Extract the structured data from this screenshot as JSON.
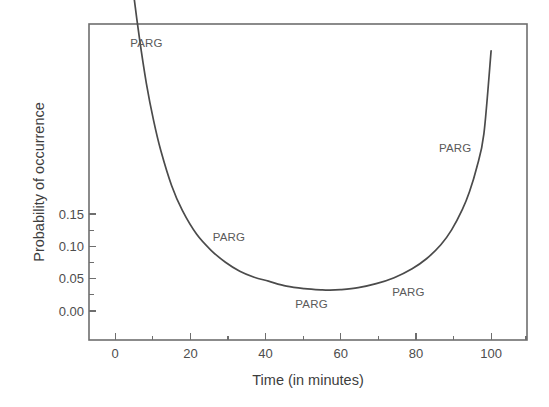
{
  "chart_data": {
    "type": "line",
    "title": "",
    "subtitle": "",
    "xlabel": "Time (in minutes)",
    "ylabel": "Probability of occurrence",
    "xlim": [
      -10,
      112
    ],
    "ylim": [
      -0.022,
      0.295
    ],
    "grid": false,
    "legend_position": "none",
    "x_ticks_major": [
      0,
      20,
      40,
      60,
      80,
      100
    ],
    "x_tick_labels": [
      "0",
      "20",
      "40",
      "60",
      "80",
      "100"
    ],
    "x_ticks_minor": [
      -10,
      10,
      30,
      50,
      70,
      90,
      110
    ],
    "y_ticks_major": [
      0.0,
      0.05,
      0.1,
      0.15
    ],
    "y_tick_labels": [
      "0.00",
      "0.05",
      "0.10",
      "0.15"
    ],
    "y_ticks_minor": [
      0.025,
      0.075,
      0.125
    ],
    "series": [
      {
        "name": "PARG",
        "x": [
          0,
          2,
          4,
          6,
          8,
          10,
          13,
          16,
          20,
          24,
          28,
          32,
          36,
          40,
          45,
          50,
          55,
          57,
          60,
          65,
          70,
          75,
          80,
          84,
          88,
          91,
          94,
          96,
          98,
          100,
          102
        ],
        "y": [
          0.405,
          0.338,
          0.282,
          0.235,
          0.198,
          0.168,
          0.133,
          0.108,
          0.084,
          0.068,
          0.056,
          0.047,
          0.041,
          0.037,
          0.032,
          0.0295,
          0.0282,
          0.028,
          0.0285,
          0.0305,
          0.0345,
          0.0405,
          0.0495,
          0.0595,
          0.0735,
          0.0885,
          0.109,
          0.127,
          0.151,
          0.185,
          0.268
        ]
      }
    ],
    "annotations": [
      {
        "label": "PARG",
        "x": 6.0,
        "y": 0.272,
        "note": "upper-left on descending branch"
      },
      {
        "label": "PARG",
        "x": 29.0,
        "y": 0.077,
        "note": "mid-left on descending branch"
      },
      {
        "label": "PARG",
        "x": 52.0,
        "y": 0.01,
        "note": "below curve minimum"
      },
      {
        "label": "PARG",
        "x": 79.0,
        "y": 0.022,
        "note": "on rising branch"
      },
      {
        "label": "PARG",
        "x": 92.0,
        "y": 0.167,
        "note": "upper-right on rising branch"
      }
    ],
    "colors": {
      "curve": "#4b4b4b",
      "frame": "#6e6e6e",
      "text": "#4d4d4d",
      "background": "#ffffff"
    }
  }
}
